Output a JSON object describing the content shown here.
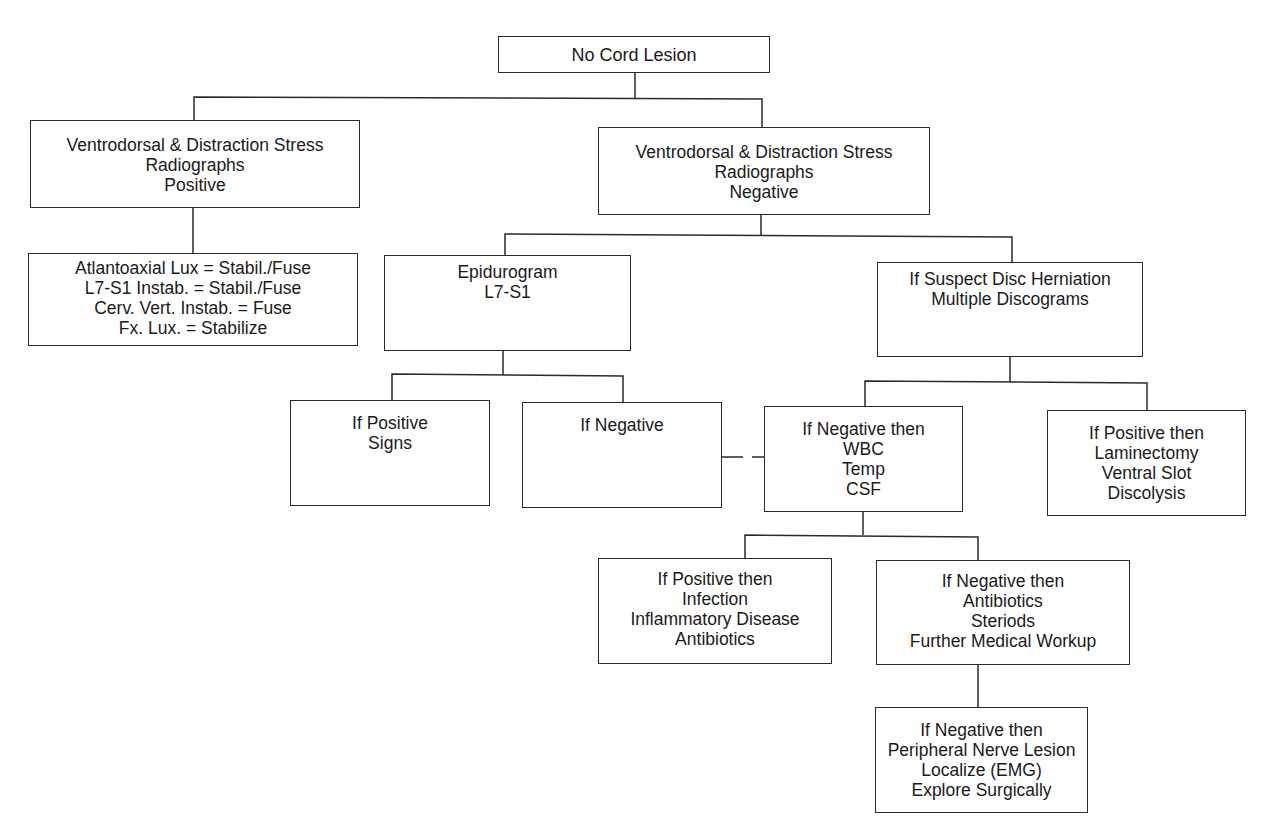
{
  "diagram": {
    "type": "flowchart",
    "root": "No Cord Lesion",
    "nodes": {
      "root": {
        "lines": [
          "No Cord Lesion"
        ]
      },
      "radiographs_positive": {
        "lines": [
          "Ventrodorsal & Distraction Stress",
          "Radiographs",
          "Positive"
        ]
      },
      "radiographs_negative": {
        "lines": [
          "Ventrodorsal & Distraction Stress",
          "Radiographs",
          "Negative"
        ]
      },
      "treatments": {
        "lines": [
          "Atlantoaxial Lux = Stabil./Fuse",
          "L7-S1 Instab. = Stabil./Fuse",
          "Cerv. Vert. Instab. = Fuse",
          "Fx. Lux. = Stabilize"
        ]
      },
      "epidurogram": {
        "lines": [
          "Epidurogram",
          "L7-S1"
        ]
      },
      "disc_herniation": {
        "lines": [
          "If Suspect Disc Herniation",
          "Multiple Discograms"
        ]
      },
      "positive_signs": {
        "lines": [
          "If Positive",
          "Signs"
        ]
      },
      "if_negative": {
        "lines": [
          "If Negative"
        ]
      },
      "negative_wbc": {
        "lines": [
          "If Negative then",
          "WBC",
          "Temp",
          "CSF"
        ]
      },
      "positive_laminectomy": {
        "lines": [
          "If Positive then",
          "Laminectomy",
          "Ventral Slot",
          "Discolysis"
        ]
      },
      "positive_infection": {
        "lines": [
          "If Positive then",
          "Infection",
          "Inflammatory Disease",
          "Antibiotics"
        ]
      },
      "negative_antibiotics": {
        "lines": [
          "If Negative then",
          "Antibiotics",
          "Steriods",
          "Further Medical Workup"
        ]
      },
      "negative_peripheral": {
        "lines": [
          "If Negative then",
          "Peripheral Nerve Lesion",
          "Localize (EMG)",
          "Explore Surgically"
        ]
      }
    },
    "edges": [
      [
        "root",
        "radiographs_positive"
      ],
      [
        "root",
        "radiographs_negative"
      ],
      [
        "radiographs_positive",
        "treatments"
      ],
      [
        "radiographs_negative",
        "epidurogram"
      ],
      [
        "radiographs_negative",
        "disc_herniation"
      ],
      [
        "epidurogram",
        "positive_signs"
      ],
      [
        "epidurogram",
        "if_negative"
      ],
      [
        "disc_herniation",
        "negative_wbc"
      ],
      [
        "disc_herniation",
        "positive_laminectomy"
      ],
      [
        "if_negative",
        "negative_wbc",
        "dashed"
      ],
      [
        "negative_wbc",
        "positive_infection"
      ],
      [
        "negative_wbc",
        "negative_antibiotics"
      ],
      [
        "negative_antibiotics",
        "negative_peripheral"
      ]
    ]
  }
}
